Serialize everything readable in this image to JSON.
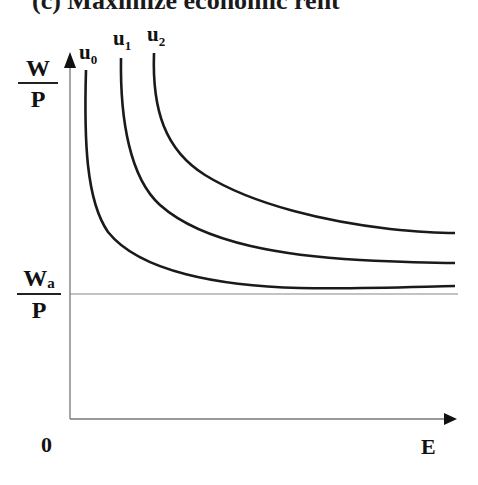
{
  "title": "(c) Maximize economic rent",
  "y_axis": {
    "label_num": "W",
    "label_den": "P"
  },
  "reference_line": {
    "label_num": "W",
    "label_num_sub": "a",
    "label_den": "P"
  },
  "x_axis": {
    "label": "E",
    "origin": "0"
  },
  "curves": [
    {
      "name": "u",
      "sub": "0"
    },
    {
      "name": "u",
      "sub": "1"
    },
    {
      "name": "u",
      "sub": "2"
    }
  ],
  "colors": {
    "curve": "#1a1a1a",
    "axis": "#777777"
  }
}
